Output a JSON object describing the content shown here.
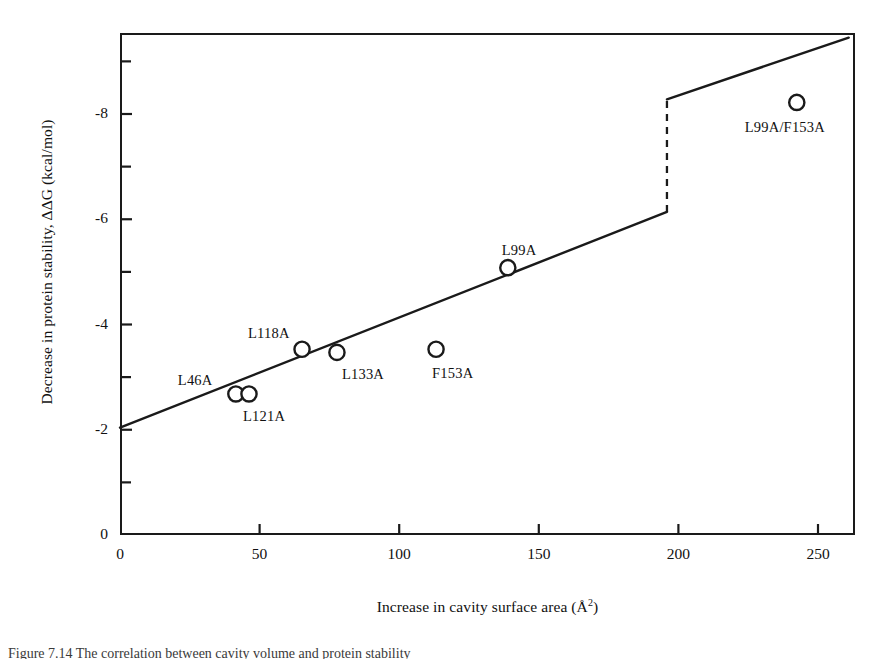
{
  "figure": {
    "caption": "Figure 7.14  The correlation between cavity volume and protein stability"
  },
  "chart_data": {
    "type": "scatter",
    "title": "",
    "xlabel": "Increase in cavity surface area (Å²)",
    "xlabel_text": "Increase in cavity surface area (Å",
    "xlabel_sup": "2",
    "xlabel_tail": ")",
    "ylabel": "Decrease in protein stability, ΔΔG (kcal/mol)",
    "xlim": [
      0,
      263
    ],
    "ylim": [
      -9.0,
      0
    ],
    "xticks": [
      0,
      50,
      100,
      150,
      200,
      250
    ],
    "xtick_labels": [
      "0",
      "50",
      "100",
      "150",
      "200",
      "250"
    ],
    "yticks": [
      0,
      -2,
      -4,
      -6,
      -8
    ],
    "ytick_labels": [
      "0",
      "-2",
      "-4",
      "-6",
      "-8"
    ],
    "yminor_ticks": [
      -1,
      -3,
      -5,
      -7,
      -9
    ],
    "grid": false,
    "legend": false,
    "marker": "open-circle",
    "points": [
      {
        "name": "L46A",
        "x": 41.5,
        "y": -2.68,
        "label": "L46A",
        "label_dx": -58,
        "label_dy": -22
      },
      {
        "name": "L121A",
        "x": 46.2,
        "y": -2.68,
        "label": "L121A",
        "label_dx": -6,
        "label_dy": 14
      },
      {
        "name": "L118A",
        "x": 65.2,
        "y": -3.53,
        "label": "L118A",
        "label_dx": -54,
        "label_dy": -24
      },
      {
        "name": "L133A",
        "x": 77.7,
        "y": -3.47,
        "label": "L133A",
        "label_dx": 5,
        "label_dy": 14
      },
      {
        "name": "F153A",
        "x": 113.2,
        "y": -3.53,
        "label": "F153A",
        "label_dx": -4,
        "label_dy": 16
      },
      {
        "name": "L99A",
        "x": 138.9,
        "y": -5.08,
        "label": "L99A",
        "label_dx": -6,
        "label_dy": -26
      },
      {
        "name": "L99A/F153A",
        "x": 242.4,
        "y": -8.22,
        "label": "L99A/F153A",
        "label_dx": -52,
        "label_dy": 17
      }
    ],
    "fit_line": {
      "description": "piecewise linear fit with vertical break",
      "segment_1": {
        "x0": 0,
        "y0": -2.04,
        "x1": 195.9,
        "y1": -6.14
      },
      "break": {
        "x": 195.9,
        "y0": -6.14,
        "y1": -8.28,
        "style": "dashed"
      },
      "segment_2": {
        "x0": 195.9,
        "y0": -8.28,
        "x1": 261.0,
        "y1": -9.45
      }
    }
  }
}
